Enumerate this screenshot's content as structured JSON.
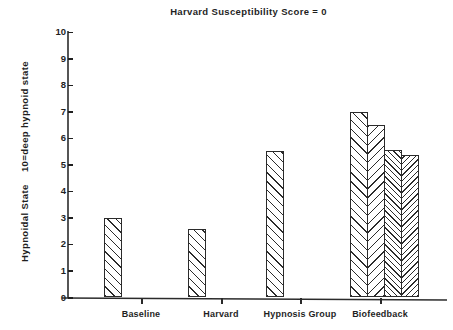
{
  "chart_data": {
    "type": "bar",
    "title": "Harvard Susceptibility Score = 0",
    "xlabel": "",
    "ylabel": "Hypnoidal State    10=deep hypnoid state",
    "ylim": [
      0,
      10
    ],
    "ytick_labels": [
      "0",
      "1",
      "2",
      "3",
      "4",
      "5",
      "6",
      "7",
      "8",
      "9",
      "10"
    ],
    "ytick_values": [
      0,
      1,
      2,
      3,
      4,
      5,
      6,
      7,
      8,
      9,
      10
    ],
    "grid": false,
    "legend": "none",
    "categories": [
      "Baseline",
      "Harvard",
      "Hypnosis Group",
      "Biofeedback"
    ],
    "bars": [
      {
        "group": "Baseline",
        "label": "Baseline",
        "value": 3.0,
        "hatch": "hatch-fwd",
        "x": 104,
        "width": 18
      },
      {
        "group": "Harvard",
        "label": "Harvard",
        "value": 2.57,
        "hatch": "hatch-fwd",
        "x": 188,
        "width": 18
      },
      {
        "group": "Hypnosis Group",
        "label": "Hypnosis Group",
        "value": 5.51,
        "hatch": "hatch-fwd",
        "x": 266,
        "width": 18
      },
      {
        "group": "Biofeedback",
        "label": "Biofeedback 1",
        "value": 7.0,
        "hatch": "hatch-fwd",
        "x": 350,
        "width": 18
      },
      {
        "group": "Biofeedback",
        "label": "Biofeedback 2",
        "value": 6.48,
        "hatch": "hatch-back",
        "x": 367,
        "width": 18
      },
      {
        "group": "Biofeedback",
        "label": "Biofeedback 3",
        "value": 5.55,
        "hatch": "hatch-fwd-dense",
        "x": 384,
        "width": 18
      },
      {
        "group": "Biofeedback",
        "label": "Biofeedback 4",
        "value": 5.36,
        "hatch": "hatch-back-dense",
        "x": 401,
        "width": 18
      }
    ],
    "category_tick_x": [
      141,
      221,
      300,
      380
    ],
    "colors": {
      "axis": "#2b2b2b",
      "bar_edge": "#2b2b2b",
      "bar_fill": "#ffffff",
      "text": "#1f1f1f"
    }
  }
}
